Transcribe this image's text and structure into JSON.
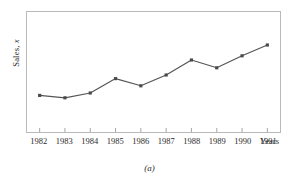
{
  "figure": {
    "caption": "(a)"
  },
  "axes": {
    "ylabel_prefix": "Sales, ",
    "ylabel_symbol": "x",
    "xaxis_title": "Years"
  },
  "chart_data": {
    "type": "line",
    "title": "",
    "subtitle": "",
    "xlabel": "Years",
    "ylabel": "Sales, x",
    "categories": [
      "1982",
      "1983",
      "1984",
      "1985",
      "1986",
      "1987",
      "1988",
      "1989",
      "1990",
      "1991"
    ],
    "x": [
      1982,
      1983,
      1984,
      1985,
      1986,
      1987,
      1988,
      1989,
      1990,
      1991
    ],
    "values": [
      3.05,
      2.85,
      3.25,
      4.45,
      3.85,
      4.75,
      6.0,
      5.35,
      6.35,
      7.25
    ],
    "ylim": [
      0,
      10
    ],
    "xlim": [
      1981.5,
      1991.5
    ],
    "grid": false,
    "legend": null,
    "marker": "square",
    "line_color": "#555555",
    "marker_color": "#4a4a4a",
    "frame_color": "#b9b9b9",
    "annotations": [
      "(a)"
    ],
    "ytick_labels": [],
    "xtick_labels": [
      "1982",
      "1983",
      "1984",
      "1985",
      "1986",
      "1987",
      "1988",
      "1989",
      "1990",
      "1991"
    ]
  }
}
